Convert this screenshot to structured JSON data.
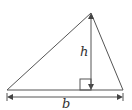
{
  "diagram": {
    "type": "triangle-area",
    "labels": {
      "height": "h",
      "base": "b"
    },
    "colors": {
      "stroke": "#555555",
      "text": "#333333",
      "background": "#ffffff"
    },
    "geometry": {
      "vertices": [
        [
          7,
          90
        ],
        [
          123,
          90
        ],
        [
          91,
          13
        ]
      ],
      "height_foot": [
        91,
        90
      ],
      "right_angle_marker": true
    }
  }
}
